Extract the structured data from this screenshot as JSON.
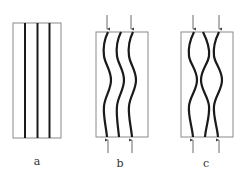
{
  "figure": {
    "colors": {
      "box_stroke": "#8a8a8a",
      "fiber": "#1a1a1a",
      "arrow": "#444444",
      "label": "#333333"
    },
    "panels": [
      {
        "id": "a",
        "label": "a",
        "description": "three straight parallel fibers in a rectangular box",
        "box": {
          "x": 13,
          "y": 23,
          "w": 48,
          "h": 115
        },
        "fiber_x": [
          25,
          37,
          49
        ],
        "fiber_style": "straight",
        "arrows": false
      },
      {
        "id": "b",
        "label": "b",
        "description": "three fibers buckled in-phase under axial compression",
        "box": {
          "x": 96,
          "y": 32,
          "w": 52,
          "h": 105
        },
        "fiber_x": [
          108,
          121,
          133
        ],
        "fiber_style": "in-phase wave",
        "arrows": true,
        "arrow_x": [
          107,
          131
        ]
      },
      {
        "id": "c",
        "label": "c",
        "description": "three fibers buckled out-of-phase (middle fiber anti-phase) under axial compression",
        "box": {
          "x": 181,
          "y": 32,
          "w": 52,
          "h": 105
        },
        "fiber_x": [
          193,
          206,
          219
        ],
        "fiber_style": "out-of-phase wave",
        "arrows": true,
        "arrow_x": [
          193,
          219
        ]
      }
    ]
  }
}
